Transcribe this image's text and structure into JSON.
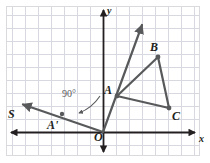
{
  "figure": {
    "kind": "coordinate-plane-rotation-diagram",
    "width": 210,
    "height": 163,
    "background": "#ffffff",
    "frame": {
      "x": 6,
      "y": 6,
      "width": 194,
      "height": 150,
      "stroke": "#d9d9de"
    }
  },
  "grid": {
    "visible": true,
    "cell": 13,
    "minor_color": "#d8d8e0",
    "major_color": "#a8a8b4",
    "major_every": 1,
    "origin_px": {
      "x": 103,
      "y": 132
    },
    "x_range_px": [
      6,
      200
    ],
    "y_range_px": [
      6,
      156
    ]
  },
  "axes": {
    "color": "#231f20",
    "x_axis": {
      "label": "x",
      "label_px": {
        "x": 199,
        "y": 134
      },
      "from_px": {
        "x": 10,
        "y": 132
      },
      "to_px": {
        "x": 196,
        "y": 132
      },
      "arrow_both_ends": true
    },
    "y_axis": {
      "label": "y",
      "label_px": {
        "x": 107,
        "y": 6
      },
      "from_px": {
        "x": 103,
        "y": 153
      },
      "to_px": {
        "x": 103,
        "y": 9
      },
      "arrow_both_ends": true
    }
  },
  "points": [
    {
      "id": "A",
      "label": "A",
      "px": {
        "x": 117,
        "y": 96
      },
      "label_px": {
        "x": 104,
        "y": 84
      },
      "dot": true
    },
    {
      "id": "B",
      "label": "B",
      "px": {
        "x": 158,
        "y": 57
      },
      "label_px": {
        "x": 150,
        "y": 41
      },
      "dot": true
    },
    {
      "id": "C",
      "label": "C",
      "px": {
        "x": 169,
        "y": 108
      },
      "label_px": {
        "x": 172,
        "y": 110
      },
      "dot": true
    },
    {
      "id": "Ap",
      "label": "A'",
      "px": {
        "x": 62,
        "y": 114
      },
      "label_px": {
        "x": 47,
        "y": 119
      },
      "dot": true
    },
    {
      "id": "S",
      "label": "S",
      "px": {
        "x": 21,
        "y": 105
      },
      "label_px": {
        "x": 8,
        "y": 108
      },
      "dot": false
    },
    {
      "id": "O",
      "label": "O",
      "px": {
        "x": 103,
        "y": 132
      },
      "label_px": {
        "x": 94,
        "y": 131
      },
      "dot": false
    }
  ],
  "triangle": {
    "name": "triangle-ABC",
    "vertices": [
      "A",
      "B",
      "C"
    ],
    "stroke": "#58595b",
    "stroke_width": 2.2
  },
  "rays": [
    {
      "name": "ray-through-A",
      "from_px": {
        "x": 103,
        "y": 132
      },
      "to_px": {
        "x": 143,
        "y": 23
      },
      "stroke": "#58595b",
      "stroke_width": 2.2,
      "arrow_at_end": true
    },
    {
      "name": "ray-through-A-prime",
      "from_px": {
        "x": 103,
        "y": 132
      },
      "to_px": {
        "x": 22,
        "y": 104
      },
      "stroke": "#58595b",
      "stroke_width": 2.2,
      "arrow_at_end": true
    }
  ],
  "annotations": {
    "angle": {
      "text": "90°",
      "text_px": {
        "x": 62,
        "y": 89
      },
      "color": "#58595b",
      "arc": {
        "name": "rotation-arc-arrow",
        "start_px": {
          "x": 100,
          "y": 96
        },
        "control_px": {
          "x": 92,
          "y": 106
        },
        "end_px": {
          "x": 78,
          "y": 113
        },
        "arrow_at_end": true
      }
    }
  },
  "colors": {
    "ink": "#231f20",
    "figure_stroke": "#58595b",
    "grid_minor": "#d8d8e0",
    "grid_major": "#a8a8b4",
    "frame": "#d9d9de",
    "background": "#ffffff"
  }
}
